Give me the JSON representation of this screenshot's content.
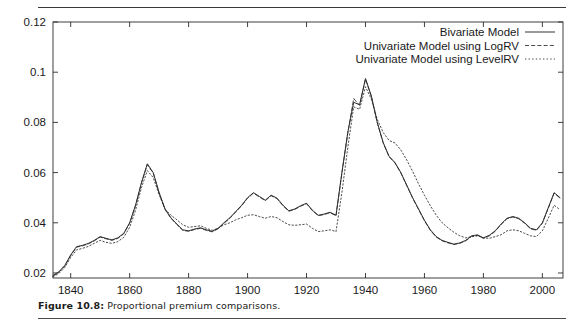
{
  "figure": {
    "caption_label": "Figure 10.8:",
    "caption_text": "Proportional premium comparisons."
  },
  "chart_data": {
    "type": "line",
    "title": "",
    "xlabel": "",
    "ylabel": "",
    "xlim": [
      1834,
      2007
    ],
    "ylim": [
      0.018,
      0.12
    ],
    "xticks": [
      1840,
      1860,
      1880,
      1900,
      1920,
      1940,
      1960,
      1980,
      2000
    ],
    "yticks": [
      0.02,
      0.04,
      0.06,
      0.08,
      0.1,
      0.12
    ],
    "xtick_labels": [
      "1840",
      "1860",
      "1880",
      "1900",
      "1920",
      "1940",
      "1960",
      "1980",
      "2000"
    ],
    "ytick_labels": [
      "0.02",
      "0.04",
      "0.06",
      "0.08",
      "0.1",
      "0.12"
    ],
    "grid": false,
    "legend_position": "top-right",
    "legend": [
      {
        "label": "Bivariate Model",
        "style": "solid"
      },
      {
        "label": "Univariate Model using LogRV",
        "style": "dashed"
      },
      {
        "label": "Univariate Model using LevelRV",
        "style": "dotted"
      }
    ],
    "x": [
      1834,
      1836,
      1838,
      1840,
      1842,
      1844,
      1846,
      1848,
      1850,
      1852,
      1854,
      1856,
      1858,
      1860,
      1862,
      1864,
      1866,
      1868,
      1870,
      1872,
      1874,
      1876,
      1878,
      1880,
      1882,
      1884,
      1886,
      1888,
      1890,
      1892,
      1894,
      1896,
      1898,
      1900,
      1902,
      1904,
      1906,
      1908,
      1910,
      1912,
      1914,
      1916,
      1918,
      1920,
      1922,
      1924,
      1926,
      1928,
      1930,
      1932,
      1934,
      1936,
      1938,
      1940,
      1942,
      1944,
      1946,
      1948,
      1950,
      1952,
      1954,
      1956,
      1958,
      1960,
      1962,
      1964,
      1966,
      1968,
      1970,
      1972,
      1974,
      1976,
      1978,
      1980,
      1982,
      1984,
      1986,
      1988,
      1990,
      1992,
      1994,
      1996,
      1998,
      2000,
      2002,
      2004,
      2006
    ],
    "series": [
      {
        "name": "Bivariate Model",
        "style": "solid",
        "values": [
          0.019,
          0.0205,
          0.023,
          0.0272,
          0.0305,
          0.031,
          0.0318,
          0.033,
          0.0345,
          0.0338,
          0.0332,
          0.034,
          0.0358,
          0.04,
          0.047,
          0.056,
          0.0635,
          0.06,
          0.052,
          0.0455,
          0.042,
          0.0395,
          0.0372,
          0.0368,
          0.0375,
          0.038,
          0.0372,
          0.0366,
          0.0378,
          0.04,
          0.042,
          0.0445,
          0.047,
          0.05,
          0.052,
          0.0505,
          0.049,
          0.051,
          0.0498,
          0.047,
          0.0448,
          0.0455,
          0.0468,
          0.0478,
          0.045,
          0.043,
          0.0435,
          0.0442,
          0.043,
          0.06,
          0.076,
          0.088,
          0.087,
          0.0975,
          0.0905,
          0.08,
          0.072,
          0.0665,
          0.064,
          0.06,
          0.055,
          0.05,
          0.0455,
          0.041,
          0.0372,
          0.0345,
          0.033,
          0.0322,
          0.0315,
          0.032,
          0.033,
          0.0348,
          0.0352,
          0.034,
          0.035,
          0.0368,
          0.0395,
          0.0418,
          0.0425,
          0.0418,
          0.04,
          0.0378,
          0.0372,
          0.04,
          0.046,
          0.052,
          0.05
        ]
      },
      {
        "name": "Univariate Model using LogRV",
        "style": "dashed",
        "values": [
          0.0188,
          0.0203,
          0.0228,
          0.027,
          0.0303,
          0.0308,
          0.0316,
          0.0328,
          0.0343,
          0.0336,
          0.033,
          0.0338,
          0.0356,
          0.0398,
          0.0468,
          0.0558,
          0.0632,
          0.0598,
          0.0518,
          0.0453,
          0.0418,
          0.0393,
          0.037,
          0.0366,
          0.0373,
          0.0378,
          0.037,
          0.0364,
          0.0376,
          0.0398,
          0.0418,
          0.0443,
          0.0468,
          0.0498,
          0.0518,
          0.0503,
          0.0488,
          0.0508,
          0.0496,
          0.0468,
          0.0446,
          0.0453,
          0.0466,
          0.0476,
          0.0448,
          0.0428,
          0.0433,
          0.044,
          0.0428,
          0.0598,
          0.0758,
          0.0895,
          0.0868,
          0.0972,
          0.0902,
          0.0798,
          0.0718,
          0.0663,
          0.0638,
          0.0598,
          0.0548,
          0.0498,
          0.0453,
          0.0408,
          0.037,
          0.0343,
          0.0328,
          0.032,
          0.0313,
          0.0318,
          0.0328,
          0.0346,
          0.035,
          0.0338,
          0.0348,
          0.0366,
          0.0393,
          0.0416,
          0.0423,
          0.0416,
          0.0398,
          0.0376,
          0.037,
          0.0398,
          0.0458,
          0.0518,
          0.0498
        ]
      },
      {
        "name": "Univariate Model using LevelRV",
        "style": "dotted",
        "values": [
          0.0185,
          0.0198,
          0.0222,
          0.0262,
          0.0292,
          0.0298,
          0.0306,
          0.0318,
          0.033,
          0.0322,
          0.0318,
          0.0325,
          0.0342,
          0.0382,
          0.045,
          0.054,
          0.0608,
          0.058,
          0.0512,
          0.0455,
          0.043,
          0.0412,
          0.0392,
          0.0382,
          0.0385,
          0.0388,
          0.0378,
          0.037,
          0.0378,
          0.0392,
          0.04,
          0.0412,
          0.042,
          0.043,
          0.0432,
          0.0425,
          0.0418,
          0.0425,
          0.042,
          0.0405,
          0.0392,
          0.039,
          0.0392,
          0.0395,
          0.0378,
          0.0365,
          0.0368,
          0.0372,
          0.0365,
          0.052,
          0.07,
          0.0862,
          0.0852,
          0.0942,
          0.0892,
          0.0812,
          0.076,
          0.0728,
          0.0718,
          0.069,
          0.065,
          0.0605,
          0.0555,
          0.051,
          0.0468,
          0.043,
          0.04,
          0.038,
          0.0362,
          0.0348,
          0.034,
          0.0345,
          0.0348,
          0.034,
          0.0338,
          0.0345,
          0.0352,
          0.0368,
          0.0372,
          0.0368,
          0.0358,
          0.0348,
          0.0345,
          0.0368,
          0.0418,
          0.047,
          0.0452
        ]
      }
    ]
  }
}
